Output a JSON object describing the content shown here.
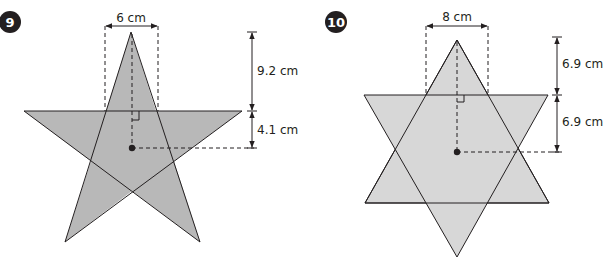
{
  "problems": [
    {
      "number": "9",
      "shape": "five-pointed star",
      "fill_color": "#b8b8b8",
      "labels": {
        "width": "6 cm",
        "upper_height": "9.2 cm",
        "lower_height": "4.1 cm"
      }
    },
    {
      "number": "10",
      "shape": "six-pointed star",
      "fill_color": "#d7d7d7",
      "labels": {
        "width": "8 cm",
        "upper_height": "6.9 cm",
        "lower_height": "6.9 cm"
      }
    }
  ],
  "colors": {
    "stroke": "#231f20",
    "badge": "#231f20"
  }
}
